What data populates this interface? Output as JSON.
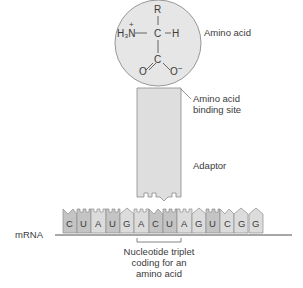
{
  "diagram": {
    "amino_acid": {
      "label": "Amino acid",
      "formula": {
        "R": "R",
        "H3N": "H₃N",
        "plus": "+",
        "C_alpha": "C",
        "H": "H",
        "C_carboxyl": "C",
        "O_left": "O",
        "O_right": "O",
        "minus": "−"
      }
    },
    "binding_site": {
      "line1": "Amino acid",
      "line2": "binding site"
    },
    "adaptor": {
      "label": "Adaptor"
    },
    "mrna": {
      "label": "mRNA",
      "sequence": [
        "C",
        "U",
        "A",
        "U",
        "G",
        "A",
        "C",
        "U",
        "A",
        "G",
        "U",
        "C",
        "G",
        "G"
      ]
    },
    "triplet": {
      "line1": "Nucleotide triplet",
      "line2": "coding for an",
      "line3": "amino acid"
    },
    "colors": {
      "circle_fill": "#e6e6e6",
      "circle_stroke": "#8c8c8c",
      "adaptor_fill": "#dedede",
      "block_light": "#dcdcdc",
      "block_dark": "#c4c4c4",
      "baseline": "#8a8a8a",
      "leader_line": "#666666"
    }
  }
}
